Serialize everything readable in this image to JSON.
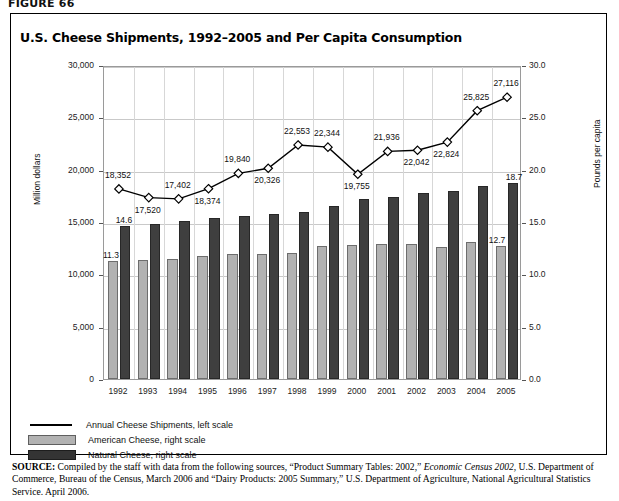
{
  "figure_label": "FIGURE 66",
  "title": "U.S. Cheese Shipments, 1992–2005 and Per Capita Consumption",
  "legend": [
    {
      "key": "line",
      "label": "Annual Cheese Shipments, left scale"
    },
    {
      "key": "american",
      "label": "American Cheese, right scale"
    },
    {
      "key": "natural",
      "label": "Natural Cheese, right scale"
    }
  ],
  "source": {
    "prefix": "SOURCE:",
    "part1": " Compiled by the staff with data from the following sources, “Product Summary Tables: 2002,” ",
    "italic1": "Economic Census 2002",
    "part2": ", U.S. Department of Commerce, Bureau of the Census, March 2006 and “Dairy Products: 2005 Summary,” U.S. Department of Agriculture, National Agricultural Statistics Service. April 2006."
  },
  "colors": {
    "american": "#b2b2b2",
    "natural": "#3f3f3f",
    "line": "#000000",
    "grid": "#c9c9c9",
    "frame": "#9a9a9a"
  },
  "chart_data": {
    "type": "bar",
    "title": "U.S. Cheese Shipments, 1992–2005 and Per Capita Consumption",
    "categories": [
      "1992",
      "1993",
      "1994",
      "1995",
      "1996",
      "1997",
      "1998",
      "1999",
      "2000",
      "2001",
      "2002",
      "2003",
      "2004",
      "2005"
    ],
    "xlabel": "",
    "left_axis": {
      "ylabel": "Million dollars",
      "ylim": [
        0,
        30000
      ],
      "ticks": [
        0,
        5000,
        10000,
        15000,
        20000,
        25000,
        30000
      ],
      "ticklabels": [
        "0",
        "5,000",
        "10,000",
        "15,000",
        "20,000",
        "25,000",
        "30,000"
      ]
    },
    "right_axis": {
      "ylabel": "Pounds per capita",
      "ylim": [
        0,
        30
      ],
      "ticks": [
        0,
        5,
        10,
        15,
        20,
        25,
        30
      ],
      "ticklabels": [
        "0.0",
        "5.0",
        "10.0",
        "15.0",
        "20.0",
        "25.0",
        "30.0"
      ]
    },
    "grid": true,
    "legend_position": "below-plot-left",
    "series": [
      {
        "name": "Annual Cheese Shipments, left scale",
        "type": "line",
        "axis": "left",
        "marker": "diamond",
        "values": [
          18352,
          17520,
          17402,
          18374,
          19840,
          20326,
          22553,
          22344,
          19755,
          21936,
          22042,
          22824,
          25825,
          27116
        ],
        "labels": [
          "18,352",
          "17,520",
          "17,402",
          "18,374",
          "19,840",
          "20,326",
          "22,553",
          "22,344",
          "19,755",
          "21,936",
          "22,042",
          "22,824",
          "25,825",
          "27,116"
        ],
        "label_positions": [
          "above",
          "below",
          "above",
          "below",
          "above",
          "below",
          "above",
          "above",
          "below",
          "above",
          "below",
          "below",
          "above",
          "above"
        ]
      },
      {
        "name": "American Cheese, right scale",
        "type": "bar",
        "axis": "right",
        "values": [
          11.3,
          11.4,
          11.5,
          11.8,
          11.9,
          11.9,
          12.0,
          12.7,
          12.8,
          12.9,
          12.9,
          12.6,
          13.1,
          12.7
        ],
        "labeled_points": {
          "1992": "11.3",
          "2005": "12.7"
        }
      },
      {
        "name": "Natural Cheese, right scale",
        "type": "bar",
        "axis": "right",
        "values": [
          14.6,
          14.8,
          15.1,
          15.4,
          15.6,
          15.8,
          16.0,
          16.5,
          17.2,
          17.4,
          17.8,
          18.0,
          18.4,
          18.7
        ],
        "labeled_points": {
          "1992": "14.6",
          "2005": "18.7"
        }
      }
    ]
  }
}
